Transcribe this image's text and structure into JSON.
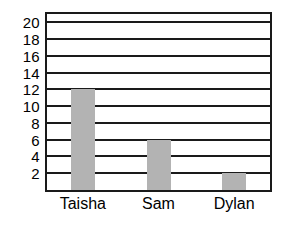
{
  "chart_data": {
    "type": "bar",
    "title": "",
    "subtitle": "",
    "xlabel": "",
    "ylabel": "",
    "categories": [
      "Taisha",
      "Sam",
      "Dylan"
    ],
    "values": [
      12,
      6,
      2
    ],
    "series": [
      {
        "name": "",
        "values": [
          12,
          6,
          2
        ]
      }
    ],
    "yticks": [
      2,
      4,
      6,
      8,
      10,
      12,
      14,
      16,
      18,
      20
    ],
    "ytick_labels": [
      "2",
      "4",
      "6",
      "8",
      "10",
      "12",
      "14",
      "16",
      "18",
      "20"
    ],
    "ylim": [
      0,
      21
    ],
    "grid": true,
    "grid_axis": "y",
    "legend": false,
    "legend_position": "none",
    "bar_color": "#b3b3b3",
    "axis_color": "#1a1a1a",
    "background_color": "#ffffff"
  },
  "axes": {
    "y": {
      "ticks": [
        {
          "label": "20",
          "value": 20
        },
        {
          "label": "18",
          "value": 18
        },
        {
          "label": "16",
          "value": 16
        },
        {
          "label": "14",
          "value": 14
        },
        {
          "label": "12",
          "value": 12
        },
        {
          "label": "10",
          "value": 10
        },
        {
          "label": "8",
          "value": 8
        },
        {
          "label": "6",
          "value": 6
        },
        {
          "label": "4",
          "value": 4
        },
        {
          "label": "2",
          "value": 2
        }
      ]
    },
    "x": {
      "ticks": [
        {
          "label": "Taisha",
          "value": 12
        },
        {
          "label": "Sam",
          "value": 6
        },
        {
          "label": "Dylan",
          "value": 2
        }
      ]
    }
  }
}
